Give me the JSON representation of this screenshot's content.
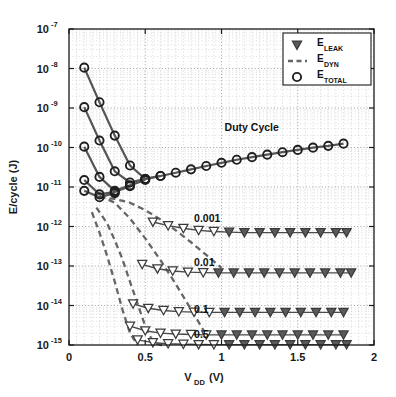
{
  "chart_data": {
    "type": "line",
    "title": "",
    "xlabel": "V_DD (V)",
    "xlabel_main": "V",
    "xlabel_sub": "DD",
    "xlabel_unit": " (V)",
    "ylabel": "E/cycle (J)",
    "xlim": [
      0,
      2
    ],
    "ylim": [
      1e-15,
      1e-07
    ],
    "yscale": "log",
    "xscale": "linear",
    "grid": true,
    "grid_minor": true,
    "xticks": [
      0,
      0.5,
      1,
      1.5,
      2
    ],
    "xticklabels": [
      "0",
      "0.5",
      "1",
      "1.5",
      "2"
    ],
    "yticks": [
      1e-07,
      1e-08,
      1e-09,
      1e-10,
      1e-11,
      1e-12,
      1e-13,
      1e-14,
      1e-15
    ],
    "yticklabels": [
      "10^-7",
      "10^-8",
      "10^-9",
      "10^-10",
      "10^-11",
      "10^-12",
      "10^-13",
      "10^-14",
      "10^-15"
    ],
    "ytick_exponents": [
      "-7",
      "-8",
      "-9",
      "-10",
      "-11",
      "-12",
      "-13",
      "-14",
      "-15"
    ],
    "ytick_base": "10",
    "legend": {
      "position": "upper right",
      "entries": [
        {
          "label_main": "E",
          "label_sub": "LEAK",
          "marker": "triangle-down",
          "style": "marker"
        },
        {
          "label_main": "E",
          "label_sub": "DYN",
          "marker": "none",
          "style": "dashed-line"
        },
        {
          "label_main": "E",
          "label_sub": "TOTAL",
          "marker": "circle",
          "style": "marker"
        }
      ]
    },
    "annotations": [
      {
        "text": "Duty Cycle",
        "x": 1.02,
        "y": 2.6e-10
      },
      {
        "text": "0.001",
        "x": 0.82,
        "y": 1.3e-12
      },
      {
        "text": "0.01",
        "x": 0.82,
        "y": 1e-13
      },
      {
        "text": "0.1",
        "x": 0.82,
        "y": 6.5e-15
      },
      {
        "text": "0.5",
        "x": 0.82,
        "y": 1.5e-15
      }
    ],
    "series": [
      {
        "name": "E_TOTAL duty 0.5",
        "kind": "total",
        "duty": 0.5,
        "color": "#555555",
        "marker": "circle",
        "x": [
          0.1,
          0.2,
          0.3,
          0.4,
          0.5,
          0.6,
          0.7,
          0.8,
          0.9,
          1.0,
          1.1,
          1.2,
          1.3,
          1.4,
          1.5,
          1.6,
          1.7,
          1.8
        ],
        "y": [
          1.05e-08,
          1.4e-09,
          2e-10,
          3.5e-11,
          1.6e-11,
          1.9e-11,
          2.3e-11,
          2.8e-11,
          3.4e-11,
          4.1e-11,
          4.9e-11,
          5.7e-11,
          6.6e-11,
          7.6e-11,
          8.7e-11,
          9.9e-11,
          1.1e-10,
          1.25e-10
        ]
      },
      {
        "name": "E_TOTAL duty 0.1",
        "kind": "total",
        "duty": 0.1,
        "color": "#555555",
        "marker": "circle",
        "x": [
          0.1,
          0.2,
          0.3,
          0.4,
          0.5,
          0.6
        ],
        "y": [
          1.05e-09,
          1.5e-10,
          2.5e-11,
          1.3e-11,
          1.6e-11,
          1.9e-11
        ]
      },
      {
        "name": "E_TOTAL duty 0.01",
        "kind": "total",
        "duty": 0.01,
        "color": "#555555",
        "marker": "circle",
        "x": [
          0.1,
          0.2,
          0.3,
          0.4,
          0.5
        ],
        "y": [
          1.05e-10,
          1.8e-11,
          8e-12,
          1.1e-11,
          1.5e-11
        ]
      },
      {
        "name": "E_TOTAL duty 0.001",
        "kind": "total",
        "duty": 0.001,
        "color": "#555555",
        "marker": "circle",
        "x": [
          0.1,
          0.2,
          0.3,
          0.4
        ],
        "y": [
          1.5e-11,
          6.5e-12,
          7.5e-12,
          1.05e-11
        ]
      },
      {
        "name": "E_TOTAL duty 0.0001",
        "kind": "total",
        "duty": 0.0001,
        "color": "#555555",
        "marker": "circle",
        "x": [
          0.1,
          0.2,
          0.3
        ],
        "y": [
          8e-12,
          5.5e-12,
          7e-12
        ]
      },
      {
        "name": "E_DYN duty 0.001",
        "kind": "dyn",
        "duty": 0.001,
        "color": "#666666",
        "style": "dashed",
        "x": [
          0.2,
          0.3,
          0.4,
          0.5,
          0.6,
          0.7,
          0.8,
          0.9,
          1.0
        ],
        "y": [
          5.5e-12,
          5e-12,
          4e-12,
          2.6e-12,
          1.5e-12,
          8e-13,
          4e-13,
          1.9e-13,
          9e-14
        ]
      },
      {
        "name": "E_DYN duty 0.01",
        "kind": "dyn",
        "duty": 0.01,
        "color": "#666666",
        "style": "dashed",
        "x": [
          0.2,
          0.3,
          0.4,
          0.5,
          0.6,
          0.7,
          0.8,
          0.9
        ],
        "y": [
          6e-12,
          4e-12,
          1.6e-12,
          5e-13,
          1.4e-13,
          3.5e-14,
          8e-15,
          1.8e-15
        ]
      },
      {
        "name": "E_DYN duty 0.1",
        "kind": "dyn",
        "duty": 0.1,
        "color": "#666666",
        "style": "dashed",
        "x": [
          0.18,
          0.25,
          0.3,
          0.35,
          0.4,
          0.45,
          0.5,
          0.55,
          0.6,
          0.65
        ],
        "y": [
          3e-12,
          1.2e-12,
          4.5e-13,
          1.5e-13,
          4e-14,
          1.1e-14,
          3e-15,
          1.2e-15,
          1e-15,
          1e-15
        ]
      },
      {
        "name": "E_DYN duty 0.5",
        "kind": "dyn",
        "duty": 0.5,
        "color": "#666666",
        "style": "dashed",
        "x": [
          0.15,
          0.2,
          0.25,
          0.3,
          0.35,
          0.4,
          0.45
        ],
        "y": [
          2.3e-12,
          7e-13,
          1.8e-13,
          4e-14,
          8e-15,
          2e-15,
          1e-15
        ]
      },
      {
        "name": "E_LEAK duty 0.001",
        "kind": "leak",
        "duty": 0.001,
        "color": "#4d4d4d",
        "marker": "triangle-down",
        "x": [
          0.55,
          0.65,
          0.75,
          0.85,
          0.95,
          1.05,
          1.15,
          1.25,
          1.35,
          1.45,
          1.55,
          1.65,
          1.75,
          1.82
        ],
        "y": [
          1.3e-12,
          1.05e-12,
          9e-13,
          8e-13,
          7.5e-13,
          7.2e-13,
          7e-13,
          7e-13,
          7e-13,
          7e-13,
          7e-13,
          7e-13,
          7e-13,
          7e-13
        ]
      },
      {
        "name": "E_LEAK duty 0.01",
        "kind": "leak",
        "duty": 0.01,
        "color": "#4d4d4d",
        "marker": "triangle-down",
        "x": [
          0.48,
          0.58,
          0.68,
          0.78,
          0.88,
          0.98,
          1.08,
          1.18,
          1.28,
          1.38,
          1.48,
          1.58,
          1.68,
          1.78,
          1.85
        ],
        "y": [
          1.1e-13,
          8.5e-14,
          7.5e-14,
          7e-14,
          6.8e-14,
          6.7e-14,
          6.7e-14,
          6.7e-14,
          6.7e-14,
          6.7e-14,
          6.7e-14,
          6.7e-14,
          6.7e-14,
          6.7e-14,
          6.7e-14
        ]
      },
      {
        "name": "E_LEAK duty 0.1",
        "kind": "leak",
        "duty": 0.1,
        "color": "#4d4d4d",
        "marker": "triangle-down",
        "x": [
          0.42,
          0.52,
          0.62,
          0.72,
          0.82,
          0.92,
          1.02,
          1.12,
          1.22,
          1.32,
          1.42,
          1.52,
          1.62,
          1.72,
          1.8
        ],
        "y": [
          1.1e-14,
          8.5e-15,
          7.5e-15,
          7e-15,
          6.8e-15,
          6.7e-15,
          6.7e-15,
          6.7e-15,
          6.7e-15,
          6.7e-15,
          6.7e-15,
          6.7e-15,
          6.7e-15,
          6.7e-15,
          6.7e-15
        ]
      },
      {
        "name": "E_LEAK duty 0.5",
        "kind": "leak",
        "duty": 0.5,
        "color": "#4d4d4d",
        "marker": "triangle-down",
        "x": [
          0.4,
          0.5,
          0.6,
          0.7,
          0.8,
          0.9,
          1.0,
          1.1,
          1.2,
          1.3,
          1.4,
          1.5,
          1.6,
          1.7,
          1.8
        ],
        "y": [
          3e-15,
          2.3e-15,
          2e-15,
          1.9e-15,
          1.85e-15,
          1.8e-15,
          1.8e-15,
          1.8e-15,
          1.8e-15,
          1.8e-15,
          1.8e-15,
          1.8e-15,
          1.8e-15,
          1.8e-15,
          1.8e-15
        ]
      },
      {
        "name": "E_LEAK duty 1.0",
        "kind": "leak",
        "duty": 1.0,
        "color": "#4d4d4d",
        "marker": "triangle-down",
        "x": [
          0.45,
          0.55,
          0.65,
          0.75,
          0.85,
          0.95,
          1.05,
          1.15,
          1.25,
          1.35,
          1.45,
          1.55,
          1.65,
          1.75,
          1.82
        ],
        "y": [
          1.35e-15,
          1.15e-15,
          1.08e-15,
          1.05e-15,
          1.03e-15,
          1.02e-15,
          1.02e-15,
          1.02e-15,
          1.02e-15,
          1.02e-15,
          1.02e-15,
          1.02e-15,
          1.02e-15,
          1.02e-15,
          1.02e-15
        ]
      }
    ],
    "colors": {
      "axis": "#1a1a1a",
      "grid": "#b4b4b4",
      "total": "#555555",
      "leak": "#4d4d4d",
      "dyn": "#666666",
      "background": "#ffffff"
    }
  }
}
